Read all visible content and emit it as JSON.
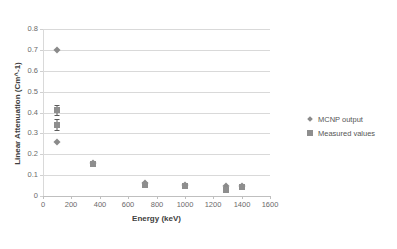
{
  "chart_data": {
    "type": "scatter",
    "title": "",
    "xlabel": "Energy (keV)",
    "ylabel": "Linear Attenuation (Cm^-1)",
    "xlim": [
      0,
      1600
    ],
    "ylim": [
      0,
      0.8
    ],
    "xticks": [
      0,
      200,
      400,
      600,
      800,
      1000,
      1200,
      1400,
      1600
    ],
    "xtick_labels": [
      "0",
      "200",
      "400",
      "600",
      "800",
      "1000",
      "1200",
      "1400",
      "1600"
    ],
    "yticks": [
      0,
      0.1,
      0.2,
      0.3,
      0.4,
      0.5,
      0.6,
      0.7,
      0.8
    ],
    "ytick_labels": [
      "0",
      "0.1",
      "0.2",
      "0.3",
      "0.4",
      "0.5",
      "0.6",
      "0.7",
      "0.8"
    ],
    "grid": "horizontal",
    "legend_position": "right",
    "series": [
      {
        "name": "MCNP output",
        "marker": "diamond",
        "color": "#8a8a8a",
        "points": [
          {
            "x": 100,
            "y": 0.7
          },
          {
            "x": 100,
            "y": 0.258
          },
          {
            "x": 350,
            "y": 0.158
          },
          {
            "x": 720,
            "y": 0.063
          },
          {
            "x": 1000,
            "y": 0.054
          },
          {
            "x": 1290,
            "y": 0.048
          },
          {
            "x": 1400,
            "y": 0.046
          }
        ]
      },
      {
        "name": "Measured values",
        "marker": "square",
        "color": "#8e8e8e",
        "points": [
          {
            "x": 100,
            "y": 0.412,
            "yerr": 0.022
          },
          {
            "x": 100,
            "y": 0.342,
            "yerr": 0.028
          },
          {
            "x": 350,
            "y": 0.152,
            "yerr": 0.006
          },
          {
            "x": 720,
            "y": 0.055,
            "yerr": 0.008
          },
          {
            "x": 1000,
            "y": 0.048,
            "yerr": 0.012
          },
          {
            "x": 1290,
            "y": 0.028,
            "yerr": 0.006
          },
          {
            "x": 1400,
            "y": 0.042,
            "yerr": 0.01
          }
        ]
      }
    ],
    "legend": [
      "MCNP output",
      "Measured values"
    ]
  }
}
